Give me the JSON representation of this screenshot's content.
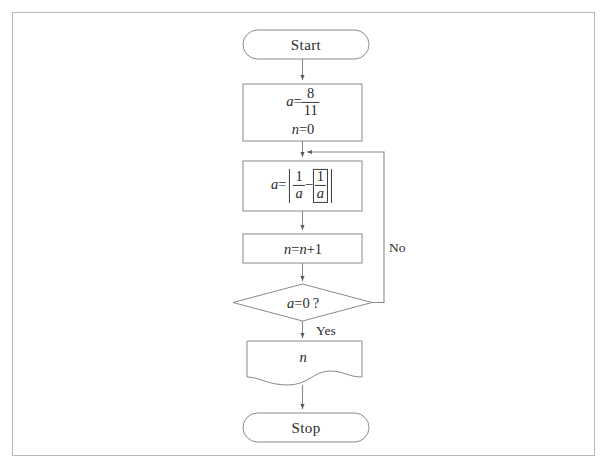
{
  "diagram": {
    "type": "flowchart",
    "border_color": "#b9b9b9",
    "stroke_color": "#8a8a8a",
    "background": "#ffffff"
  },
  "nodes": {
    "start": {
      "shape": "terminator",
      "label": "Start"
    },
    "init": {
      "shape": "process",
      "line1_var": "a",
      "line1_eq": "=",
      "line1_numerator": "8",
      "line1_denominator": "11",
      "line2": "n = 0",
      "line2_var": "n",
      "line2_eq": "=",
      "line2_value": "0"
    },
    "compute": {
      "shape": "process",
      "var": "a",
      "eq": "=",
      "numerator1": "1",
      "denominator1": "a",
      "minus": "−",
      "numerator2": "1",
      "denominator2": "a"
    },
    "increment": {
      "shape": "process",
      "label": "n = n + 1",
      "var": "n",
      "eq": "=",
      "rhs_var": "n",
      "plus": "+",
      "rhs_value": "1"
    },
    "decision": {
      "shape": "diamond",
      "var": "a",
      "eq": "=",
      "value": "0",
      "question": "?"
    },
    "output": {
      "shape": "document",
      "label": "n"
    },
    "stop": {
      "shape": "terminator",
      "label": "Stop"
    }
  },
  "edges": {
    "yes_label": "Yes",
    "no_label": "No"
  }
}
